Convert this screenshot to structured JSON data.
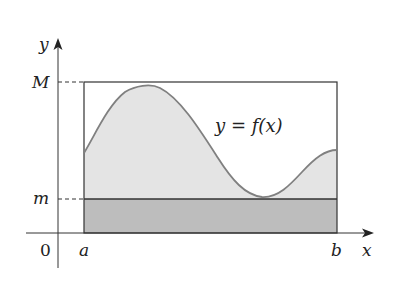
{
  "figure": {
    "colors": {
      "axis": "#333333",
      "box_outline": "#333333",
      "curve": "#808080",
      "area_under_curve": "#e4e4e4",
      "lower_rectangle": "#bdbdbd",
      "dashed_guides": "#333333",
      "background": "#ffffff"
    },
    "labels": {
      "y_axis": "y",
      "x_axis": "x",
      "upper_bound": "M",
      "lower_bound": "m",
      "origin": "0",
      "left_endpoint": "a",
      "right_endpoint": "b",
      "curve_label": "y = f(x)"
    }
  }
}
